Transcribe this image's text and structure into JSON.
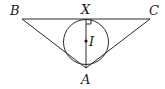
{
  "diagram": {
    "type": "geometry",
    "points": {
      "B": {
        "label": "B",
        "x": 22,
        "y": 19
      },
      "C": {
        "label": "C",
        "x": 150,
        "y": 19
      },
      "X": {
        "label": "X",
        "x": 86,
        "y": 19
      },
      "A": {
        "label": "A",
        "x": 86,
        "y": 68
      },
      "I": {
        "label": "I",
        "x": 86,
        "y": 41
      }
    },
    "circle": {
      "center": "I",
      "radius": 22
    },
    "segments": [
      [
        "B",
        "C"
      ],
      [
        "B",
        "A"
      ],
      [
        "C",
        "A"
      ],
      [
        "X",
        "A"
      ]
    ],
    "right_angle_at": "X",
    "colors": {
      "stroke": "#2a2a2a",
      "text": "#1a1a1a",
      "background": "#ffffff"
    }
  }
}
